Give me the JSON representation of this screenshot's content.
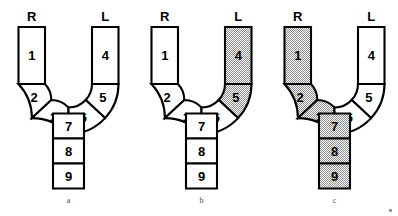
{
  "image": {
    "width": 398,
    "height": 216,
    "background_color": "#ffffff",
    "line_color": "#000000",
    "shade_fill_color": "#cccccc"
  },
  "figures": [
    {
      "caption": "a",
      "label_right": "R",
      "label_left": "L",
      "cells": [
        {
          "number": "1",
          "shaded": false
        },
        {
          "number": "2",
          "shaded": false
        },
        {
          "number": "3",
          "shaded": false
        },
        {
          "number": "4",
          "shaded": false
        },
        {
          "number": "5",
          "shaded": false
        },
        {
          "number": "6",
          "shaded": false
        },
        {
          "number": "7",
          "shaded": false
        },
        {
          "number": "8",
          "shaded": false
        },
        {
          "number": "9",
          "shaded": false
        }
      ]
    },
    {
      "caption": "b",
      "label_right": "R",
      "label_left": "L",
      "cells": [
        {
          "number": "1",
          "shaded": false
        },
        {
          "number": "2",
          "shaded": false
        },
        {
          "number": "3",
          "shaded": false
        },
        {
          "number": "4",
          "shaded": true
        },
        {
          "number": "5",
          "shaded": true
        },
        {
          "number": "6",
          "shaded": false
        },
        {
          "number": "7",
          "shaded": false
        },
        {
          "number": "8",
          "shaded": false
        },
        {
          "number": "9",
          "shaded": false
        }
      ]
    },
    {
      "caption": "c",
      "label_right": "R",
      "label_left": "L",
      "cells": [
        {
          "number": "1",
          "shaded": true
        },
        {
          "number": "2",
          "shaded": true
        },
        {
          "number": "3",
          "shaded": true
        },
        {
          "number": "4",
          "shaded": false
        },
        {
          "number": "5",
          "shaded": false
        },
        {
          "number": "6",
          "shaded": false
        },
        {
          "number": "7",
          "shaded": true
        },
        {
          "number": "8",
          "shaded": true
        },
        {
          "number": "9",
          "shaded": true
        }
      ]
    }
  ]
}
